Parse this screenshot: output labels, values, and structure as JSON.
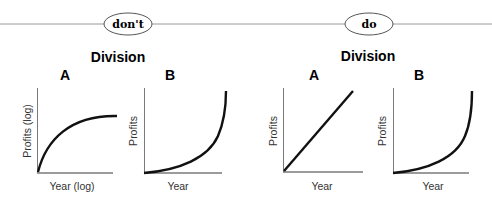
{
  "panels": [
    {
      "tag": "don't",
      "heading": "Division",
      "charts": [
        {
          "letter": "A",
          "ylabel": "Profits (log)",
          "xlabel": "Year (log)",
          "curve": "concave-saturating"
        },
        {
          "letter": "B",
          "ylabel": "Profits",
          "xlabel": "Year",
          "curve": "exponential"
        }
      ]
    },
    {
      "tag": "do",
      "heading": "Division",
      "charts": [
        {
          "letter": "A",
          "ylabel": "Profits",
          "xlabel": "Year",
          "curve": "linear"
        },
        {
          "letter": "B",
          "ylabel": "Profits",
          "xlabel": "Year",
          "curve": "exponential"
        }
      ]
    }
  ],
  "colors": {
    "line": "#9a9a9a",
    "axis": "#7a7a7a",
    "curve": "#111111",
    "text": "#1a1a1a"
  }
}
